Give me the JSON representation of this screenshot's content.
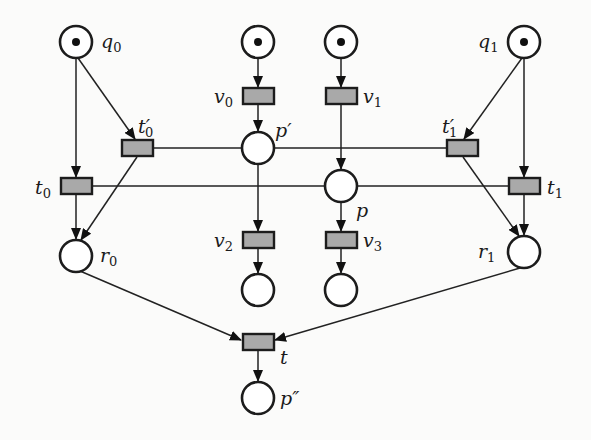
{
  "diagram": {
    "type": "petri-net",
    "places": [
      {
        "id": "q0",
        "label": "q",
        "sub": "0",
        "prime": "",
        "x": 76,
        "y": 42,
        "token": true
      },
      {
        "id": "pv0in",
        "label": "",
        "sub": "",
        "prime": "",
        "x": 258,
        "y": 42,
        "token": true
      },
      {
        "id": "pv1in",
        "label": "",
        "sub": "",
        "prime": "",
        "x": 341,
        "y": 42,
        "token": true
      },
      {
        "id": "q1",
        "label": "q",
        "sub": "1",
        "prime": "",
        "x": 524,
        "y": 42,
        "token": true
      },
      {
        "id": "p_prime",
        "label": "p",
        "sub": "",
        "prime": "′",
        "x": 258,
        "y": 148,
        "token": false
      },
      {
        "id": "p",
        "label": "p",
        "sub": "",
        "prime": "",
        "x": 341,
        "y": 186,
        "token": false
      },
      {
        "id": "r0",
        "label": "r",
        "sub": "0",
        "prime": "",
        "x": 76,
        "y": 256,
        "token": false
      },
      {
        "id": "r1",
        "label": "r",
        "sub": "1",
        "prime": "",
        "x": 524,
        "y": 252,
        "token": false
      },
      {
        "id": "pv2out",
        "label": "",
        "sub": "",
        "prime": "",
        "x": 258,
        "y": 290,
        "token": false
      },
      {
        "id": "pv3out",
        "label": "",
        "sub": "",
        "prime": "",
        "x": 341,
        "y": 290,
        "token": false
      },
      {
        "id": "p_dprime",
        "label": "p",
        "sub": "",
        "prime": "″",
        "x": 258,
        "y": 398,
        "token": false
      }
    ],
    "transitions": [
      {
        "id": "v0",
        "label": "v",
        "sub": "0",
        "prime": "",
        "x": 258,
        "y": 96
      },
      {
        "id": "v1",
        "label": "v",
        "sub": "1",
        "prime": "",
        "x": 341,
        "y": 96
      },
      {
        "id": "t0p",
        "label": "t",
        "sub": "0",
        "prime": "′",
        "x": 137,
        "y": 148
      },
      {
        "id": "t1p",
        "label": "t",
        "sub": "1",
        "prime": "′",
        "x": 462,
        "y": 148
      },
      {
        "id": "t0",
        "label": "t",
        "sub": "0",
        "prime": "",
        "x": 76,
        "y": 186
      },
      {
        "id": "t1",
        "label": "t",
        "sub": "1",
        "prime": "",
        "x": 524,
        "y": 186
      },
      {
        "id": "v2",
        "label": "v",
        "sub": "2",
        "prime": "",
        "x": 258,
        "y": 240
      },
      {
        "id": "v3",
        "label": "v",
        "sub": "3",
        "prime": "",
        "x": 341,
        "y": 240
      },
      {
        "id": "t",
        "label": "t",
        "sub": "",
        "prime": "",
        "x": 258,
        "y": 342
      }
    ],
    "labels": {
      "q0": "q",
      "q0_sub": "0",
      "q1": "q",
      "q1_sub": "1",
      "v0": "v",
      "v0_sub": "0",
      "v1": "v",
      "v1_sub": "1",
      "v2": "v",
      "v2_sub": "2",
      "v3": "v",
      "v3_sub": "3",
      "t0p": "t′",
      "t0p_sub": "0",
      "t1p": "t′",
      "t1p_sub": "1",
      "t0": "t",
      "t0_sub": "0",
      "t1": "t",
      "t1_sub": "1",
      "p_prime": "p′",
      "p": "p",
      "r0": "r",
      "r0_sub": "0",
      "r1": "r",
      "r1_sub": "1",
      "t": "t",
      "p_dprime": "p″"
    },
    "arcs": [
      [
        "q0",
        "t0"
      ],
      [
        "q0",
        "t0p"
      ],
      [
        "pv0in",
        "v0"
      ],
      [
        "pv1in",
        "v1"
      ],
      [
        "q1",
        "t1p"
      ],
      [
        "q1",
        "t1"
      ],
      [
        "v0",
        "p_prime"
      ],
      [
        "v1",
        "p"
      ],
      [
        "t0p",
        "p_prime",
        "read"
      ],
      [
        "p_prime",
        "t1p",
        "read"
      ],
      [
        "t0",
        "p",
        "read"
      ],
      [
        "p",
        "t1",
        "read"
      ],
      [
        "p_prime",
        "v2"
      ],
      [
        "p",
        "v3"
      ],
      [
        "v2",
        "pv2out"
      ],
      [
        "v3",
        "pv3out"
      ],
      [
        "t0",
        "r0"
      ],
      [
        "t0p",
        "r0"
      ],
      [
        "t1",
        "r1"
      ],
      [
        "t1p",
        "r1"
      ],
      [
        "r0",
        "t"
      ],
      [
        "r1",
        "t"
      ],
      [
        "t",
        "p_dprime"
      ]
    ]
  }
}
